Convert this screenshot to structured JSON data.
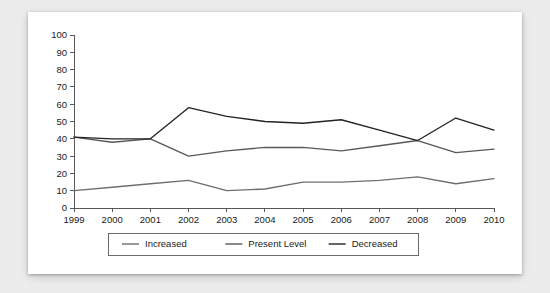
{
  "chart_data": {
    "type": "line",
    "title": "",
    "subtitle": "",
    "xlabel": "",
    "ylabel": "",
    "categories": [
      "1999",
      "2000",
      "2001",
      "2002",
      "2003",
      "2004",
      "2005",
      "2006",
      "2007",
      "2008",
      "2009",
      "2010"
    ],
    "x": [
      1999,
      2000,
      2001,
      2002,
      2003,
      2004,
      2005,
      2006,
      2007,
      2008,
      2009,
      2010
    ],
    "ylim": [
      0,
      100
    ],
    "xlim": [
      1999,
      2010
    ],
    "yticks": [
      0,
      10,
      20,
      30,
      40,
      50,
      60,
      70,
      80,
      90,
      100
    ],
    "ytick_labels": [
      "0",
      "10",
      "20",
      "30",
      "40",
      "50",
      "60",
      "70",
      "80",
      "90",
      "100"
    ],
    "grid": false,
    "legend_position": "bottom",
    "series": [
      {
        "name": "Increased",
        "color": "#6e6e70",
        "values": [
          10,
          12,
          14,
          16,
          10,
          11,
          15,
          15,
          16,
          18,
          14,
          17
        ]
      },
      {
        "name": "Present Level",
        "color": "#58585a",
        "values": [
          41,
          38,
          40,
          30,
          33,
          35,
          35,
          33,
          36,
          39,
          32,
          34
        ]
      },
      {
        "name": "Decreased",
        "color": "#232326",
        "values": [
          41,
          40,
          40,
          58,
          53,
          50,
          49,
          51,
          45,
          39,
          52,
          45
        ]
      }
    ]
  },
  "legend": {
    "entries": [
      {
        "label": "Increased"
      },
      {
        "label": "Present Level"
      },
      {
        "label": "Decreased"
      }
    ]
  }
}
